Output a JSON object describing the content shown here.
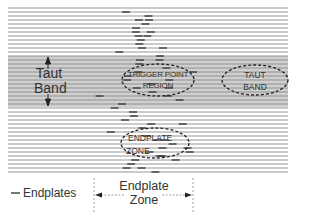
{
  "diagram": {
    "type": "muscle-fiber-schematic",
    "colors": {
      "fiber_line": "#8a8a8a",
      "taut_band_fill": "#cfcfcf",
      "endplate_mark": "#3a3a3a",
      "outline": "#2a2a2a",
      "text": "#333333"
    },
    "fibers": {
      "x_start": 8,
      "x_end": 288,
      "y_start": 8,
      "y_end": 172,
      "spacing": 4
    },
    "taut_band": {
      "y_top": 56,
      "y_bottom": 107
    },
    "labels": {
      "taut_band_side_line1": "Taut",
      "taut_band_side_line2": "Band",
      "trigger_point_line1": "TRIGGER POINT",
      "trigger_point_line2": "REGION",
      "taut_band_oval_line1": "TAUT",
      "taut_band_oval_line2": "BAND",
      "endplate_zone_oval_line1": "ENDPLATE",
      "endplate_zone_oval_line2": "ZONE",
      "legend": "Endplates",
      "zone_dimension_line1": "Endplate",
      "zone_dimension_line2": "Zone"
    },
    "ovals": [
      {
        "name": "trigger-point-region",
        "cx": 158,
        "cy": 80,
        "rx": 36,
        "ry": 16
      },
      {
        "name": "taut-band-region",
        "cx": 255,
        "cy": 80,
        "rx": 33,
        "ry": 15
      },
      {
        "name": "endplate-zone-region",
        "cx": 155,
        "cy": 143,
        "rx": 34,
        "ry": 15
      }
    ],
    "endplate_zone_bounds": {
      "x_left": 94,
      "x_right": 193
    }
  }
}
